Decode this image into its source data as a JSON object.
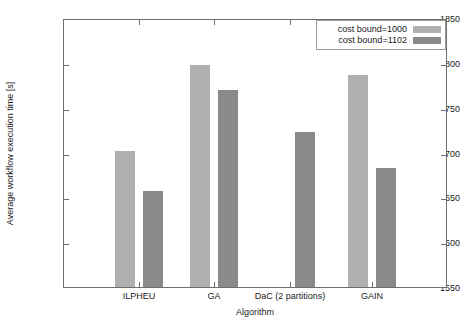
{
  "chart_data": {
    "type": "bar",
    "title": "",
    "xlabel": "Algorithm",
    "ylabel": "Average workflow execution time [s]",
    "categories": [
      "ILPHEU",
      "GA",
      "DaC (2 partitions)",
      "GAIN"
    ],
    "series": [
      {
        "name": "cost bound=1000",
        "color": "#b0b0b0",
        "values": [
          1702,
          1798,
          null,
          1786
        ]
      },
      {
        "name": "cost bound=1102",
        "color": "#8a8a8a",
        "values": [
          1657,
          1770,
          1723,
          1683
        ]
      }
    ],
    "ylim": [
      1550,
      1850
    ],
    "yticks": [
      1550,
      1600,
      1650,
      1700,
      1750,
      1800,
      1850
    ],
    "ytick_labels": [
      "1550",
      "1600",
      "1650",
      "1700",
      "1750",
      "1800",
      "1850"
    ],
    "grid": false,
    "legend_position": "top-right"
  },
  "axes": {
    "y_title": "Average workflow execution time [s]",
    "x_title": "Algorithm",
    "y_ticks": [
      "1850",
      "1800",
      "1750",
      "1700",
      "1650",
      "1600",
      "1550"
    ],
    "x_ticks": [
      "ILPHEU",
      "GA",
      "DaC (2 partitions)",
      "GAIN"
    ]
  },
  "legend": {
    "entries": [
      {
        "label": "cost bound=1000",
        "color": "#b0b0b0"
      },
      {
        "label": "cost bound=1102",
        "color": "#8a8a8a"
      }
    ]
  },
  "colors": {
    "series_light": "#b0b0b0",
    "series_dark": "#8a8a8a",
    "axis": "#6e6e6e",
    "text": "#1a1a1a",
    "background": "#ffffff"
  }
}
